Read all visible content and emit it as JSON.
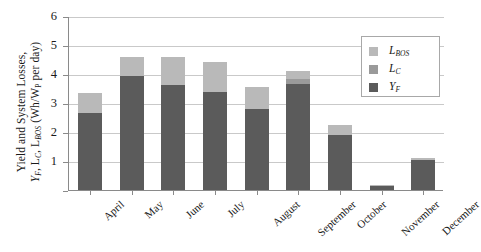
{
  "chart_data": {
    "type": "bar",
    "stacked": true,
    "title": "",
    "subtitle": "",
    "xlabel": "",
    "ylabel": "Yield and System Losses, Y_F, L_C, L_BOS (Wh/W_P per day)",
    "ylabel_line1": "Yield and System Losses,",
    "ylabel_line2": "Y_F, L_C, L_BOS (Wh/W_P per day)",
    "categories": [
      "April",
      "May",
      "June",
      "July",
      "August",
      "September",
      "October",
      "November",
      "December"
    ],
    "series": [
      {
        "name": "Y_F",
        "legend_label": "Y_F",
        "color": "#5b5b5b",
        "values": [
          2.67,
          3.94,
          3.63,
          3.39,
          2.81,
          3.66,
          1.88,
          0.15,
          1.05
        ]
      },
      {
        "name": "L_C",
        "legend_label": "L_C",
        "color": "#9a9a9a",
        "values": [
          0.0,
          0.0,
          0.0,
          0.0,
          0.0,
          0.18,
          0.0,
          0.0,
          0.0
        ]
      },
      {
        "name": "L_BOS",
        "legend_label": "L_BOS",
        "color": "#b9b9b9",
        "values": [
          0.68,
          0.65,
          0.96,
          1.03,
          0.75,
          0.27,
          0.35,
          0.02,
          0.05
        ]
      }
    ],
    "totals": [
      3.35,
      4.59,
      4.59,
      4.42,
      3.56,
      4.11,
      2.23,
      0.17,
      1.1
    ],
    "ylim": [
      0,
      6
    ],
    "yticks": [
      0,
      1,
      2,
      3,
      4,
      5,
      6
    ],
    "ytick_labels": [
      "",
      "1",
      "2",
      "3",
      "4",
      "5",
      "6"
    ],
    "grid": true,
    "legend_position": "top-right",
    "legend_entries": [
      "L_BOS",
      "L_C",
      "Y_F"
    ],
    "axis_color": "#8a8a8a",
    "grid_color": "#c9c9c9",
    "background": "#ffffff"
  },
  "axis": {
    "y_labels": [
      "6",
      "5",
      "4",
      "3",
      "2",
      "1"
    ],
    "y_title_main": "Yield and System Losses,",
    "y_title_symbols_pre": "Y",
    "y_title_sub1": "F",
    "y_title_mid": ", L",
    "y_title_sub2": "C",
    "y_title_mid2": ", L",
    "y_title_sub3": "BOS",
    "y_title_units_pre": " (Wh/W",
    "y_title_sub4": "P",
    "y_title_units_post": " per day)"
  },
  "legend": {
    "items": [
      {
        "label_base": "L",
        "label_sub": "BOS",
        "color": "#b9b9b9"
      },
      {
        "label_base": "L",
        "label_sub": "C",
        "color": "#9a9a9a"
      },
      {
        "label_base": "Y",
        "label_sub": "F",
        "color": "#5b5b5b"
      }
    ]
  }
}
